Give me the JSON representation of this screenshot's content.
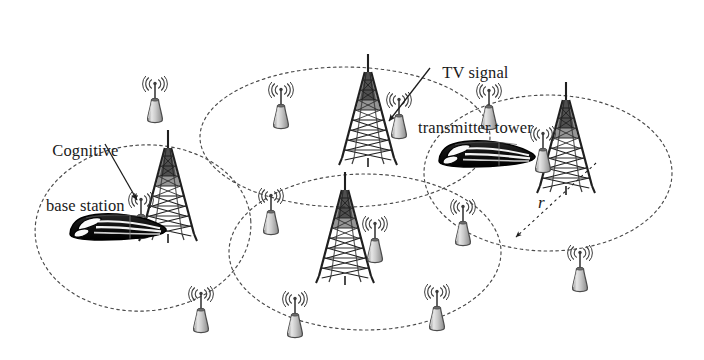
{
  "figure": {
    "background_color": "#ffffff",
    "width": 704,
    "height": 360
  },
  "annotations": {
    "cognitive_base_station": {
      "line1": "Cognitive",
      "line2": "base station",
      "full_text": "Cognitive base station",
      "leader_line": "diagonal pointer to nearby cognitive base station icon"
    },
    "tv_transmitter": {
      "line1": "TV signal",
      "line2": "transmitter tower",
      "full_text": "TV signal transmitter tower",
      "leader_line": "diagonal arrow pointing to the TV tower"
    },
    "radius": {
      "symbol": "r",
      "meaning": "cell coverage radius",
      "style": "italic"
    }
  },
  "colors": {
    "stroke": "#262626",
    "ellipse_dash": "#4a4a4a",
    "tower_dark": "#1f1f1f",
    "tower_mid": "#555555",
    "bs_body_light": "#d8d8d8",
    "bs_body_mid": "#9e9e9e",
    "bs_outline": "#4c4c4c",
    "train_dark": "#141414",
    "train_light": "#fbfbfb",
    "label_text": "#1a1a1a"
  },
  "coverage_cells": [
    {
      "id": "cell-left",
      "name": "left-coverage-ellipse",
      "cx": 143,
      "cy": 228,
      "rx": 108,
      "ry": 83,
      "rotation": -4
    },
    {
      "id": "cell-top-middle",
      "name": "top-middle-coverage-ellipse",
      "cx": 345,
      "cy": 137,
      "rx": 145,
      "ry": 70,
      "rotation": 0
    },
    {
      "id": "cell-bottom-middle",
      "name": "bottom-middle-coverage-ellipse",
      "cx": 365,
      "cy": 252,
      "rx": 136,
      "ry": 78,
      "rotation": 0
    },
    {
      "id": "cell-right",
      "name": "right-coverage-ellipse",
      "cx": 548,
      "cy": 173,
      "rx": 124,
      "ry": 78,
      "rotation": 0
    }
  ],
  "tv_towers": [
    {
      "id": "tower-left",
      "name": "tv-transmitter-tower-left",
      "x": 168,
      "y": 130,
      "height": 104,
      "width": 54,
      "label_target": false
    },
    {
      "id": "tower-top",
      "name": "tv-transmitter-tower-top",
      "x": 368,
      "y": 52,
      "height": 106,
      "width": 56,
      "label_target": true
    },
    {
      "id": "tower-bottom",
      "name": "tv-transmitter-tower-bottom",
      "x": 345,
      "y": 176,
      "height": 100,
      "width": 54,
      "label_target": false
    },
    {
      "id": "tower-right",
      "name": "tv-transmitter-tower-right",
      "x": 566,
      "y": 78,
      "height": 108,
      "width": 56,
      "label_target": false
    }
  ],
  "base_stations": [
    {
      "id": "bs-1",
      "name": "cognitive-base-station-1",
      "x": 155,
      "y": 80,
      "scale": 1.0
    },
    {
      "id": "bs-2",
      "name": "cognitive-base-station-2",
      "x": 281,
      "y": 86,
      "scale": 1.0
    },
    {
      "id": "bs-3",
      "name": "cognitive-base-station-3",
      "x": 141,
      "y": 196,
      "scale": 1.0
    },
    {
      "id": "bs-4",
      "name": "cognitive-base-station-4",
      "x": 271,
      "y": 192,
      "scale": 1.0
    },
    {
      "id": "bs-5",
      "name": "cognitive-base-station-5",
      "x": 399,
      "y": 96,
      "scale": 1.0
    },
    {
      "id": "bs-6",
      "name": "cognitive-base-station-6",
      "x": 489,
      "y": 87,
      "scale": 1.0
    },
    {
      "id": "bs-7",
      "name": "cognitive-base-station-7",
      "x": 463,
      "y": 203,
      "scale": 1.0
    },
    {
      "id": "bs-8",
      "name": "cognitive-base-station-8",
      "x": 543,
      "y": 130,
      "scale": 1.0
    },
    {
      "id": "bs-9",
      "name": "cognitive-base-station-9",
      "x": 375,
      "y": 220,
      "scale": 1.0
    },
    {
      "id": "bs-10",
      "name": "cognitive-base-station-10",
      "x": 201,
      "y": 290,
      "scale": 1.0
    },
    {
      "id": "bs-11",
      "name": "cognitive-base-station-11",
      "x": 295,
      "y": 295,
      "scale": 1.0
    },
    {
      "id": "bs-12",
      "name": "cognitive-base-station-12",
      "x": 437,
      "y": 288,
      "scale": 1.0
    },
    {
      "id": "bs-13",
      "name": "cognitive-base-station-13",
      "x": 580,
      "y": 249,
      "scale": 1.0
    }
  ],
  "trains": [
    {
      "id": "train-left",
      "name": "high-speed-train-left",
      "x": 68,
      "y": 213,
      "width": 96,
      "height": 36,
      "direction": "right"
    },
    {
      "id": "train-right",
      "name": "high-speed-train-right",
      "x": 437,
      "y": 140,
      "width": 96,
      "height": 36,
      "direction": "right"
    }
  ],
  "leaders": [
    {
      "id": "leader-cognitive",
      "name": "cognitive-label-leader-line",
      "x1": 105,
      "y1": 144,
      "x2": 137,
      "y2": 200,
      "arrow": true
    },
    {
      "id": "leader-tv",
      "name": "tv-label-leader-line",
      "x1": 430,
      "y1": 68,
      "x2": 389,
      "y2": 121,
      "arrow": true
    },
    {
      "id": "leader-radius",
      "name": "radius-leader-line",
      "x1": 596,
      "y1": 163,
      "x2": 516,
      "y2": 237,
      "arrow": true
    }
  ]
}
